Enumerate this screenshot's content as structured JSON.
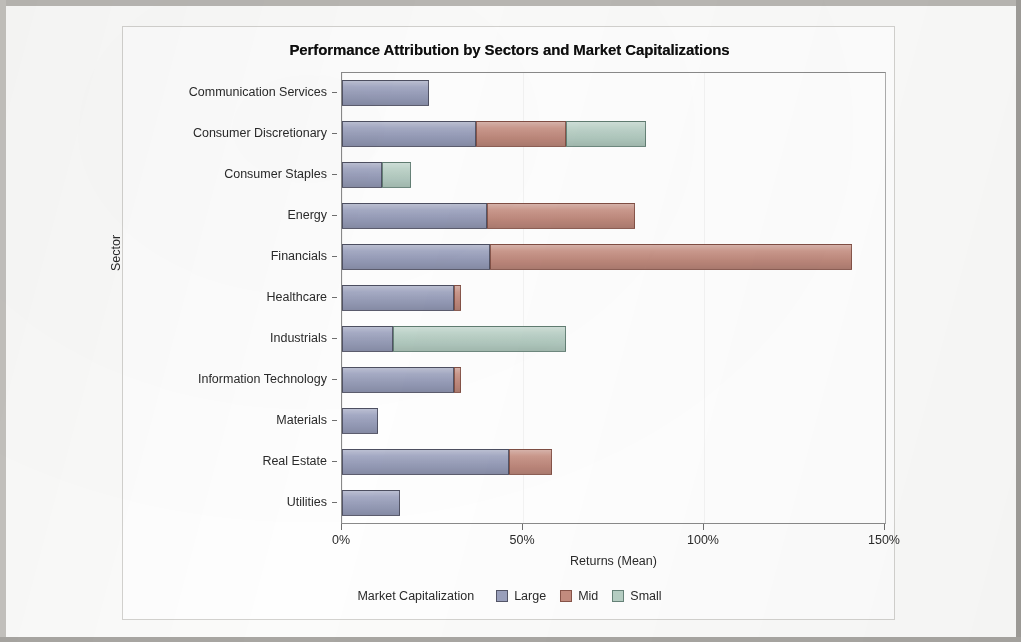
{
  "chart_data": {
    "type": "bar",
    "orientation": "horizontal",
    "stacked": true,
    "title": "Performance Attribution by Sectors and Market Capitalizations",
    "xlabel": "Returns (Mean)",
    "ylabel": "Sector",
    "xlim": [
      0,
      150
    ],
    "x_tick_labels": [
      "0%",
      "50%",
      "100%",
      "150%"
    ],
    "x_tick_values": [
      0,
      50,
      100,
      150
    ],
    "grid": false,
    "legend_title": "Market Capitalization",
    "legend_position": "bottom",
    "categories": [
      "Communication Services",
      "Consumer Discretionary",
      "Consumer Staples",
      "Energy",
      "Financials",
      "Healthcare",
      "Industrials",
      "Information Technology",
      "Materials",
      "Real Estate",
      "Utilities"
    ],
    "series": [
      {
        "name": "Large",
        "color": "#9aa0bd",
        "values": [
          24,
          37,
          11,
          40,
          41,
          31,
          14,
          31,
          10,
          46,
          16
        ]
      },
      {
        "name": "Mid",
        "color": "#c58d80",
        "values": [
          0,
          25,
          0,
          41,
          100,
          2,
          0,
          2,
          0,
          12,
          0
        ]
      },
      {
        "name": "Small",
        "color": "#b6cfc4",
        "values": [
          0,
          22,
          8,
          0,
          0,
          0,
          48,
          0,
          0,
          0,
          0
        ]
      }
    ],
    "totals": [
      24,
      84,
      19,
      81,
      141,
      33,
      62,
      33,
      10,
      58,
      16
    ]
  },
  "legend": {
    "title": "Market Capitalization",
    "entries": [
      {
        "label": "Large",
        "color": "#9aa0bd"
      },
      {
        "label": "Mid",
        "color": "#c58d80"
      },
      {
        "label": "Small",
        "color": "#b6cfc4"
      }
    ]
  }
}
